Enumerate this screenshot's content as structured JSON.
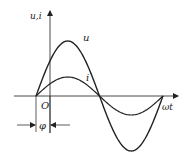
{
  "diagram": {
    "title": "",
    "axes": {
      "vertical_label": "u,i",
      "horizontal_label": "ωt",
      "origin_label": "O"
    },
    "curves": [
      {
        "name": "u",
        "label": "u",
        "amplitude_px": 55,
        "description": "voltage waveform (larger amplitude)"
      },
      {
        "name": "i",
        "label": "i",
        "amplitude_px": 19,
        "description": "current waveform (smaller amplitude), in phase with u"
      }
    ],
    "phase_marker": {
      "label": "φ",
      "description": "phase offset between waveform start and origin O"
    },
    "colors": {
      "stroke": "#222222",
      "background": "#ffffff"
    }
  }
}
